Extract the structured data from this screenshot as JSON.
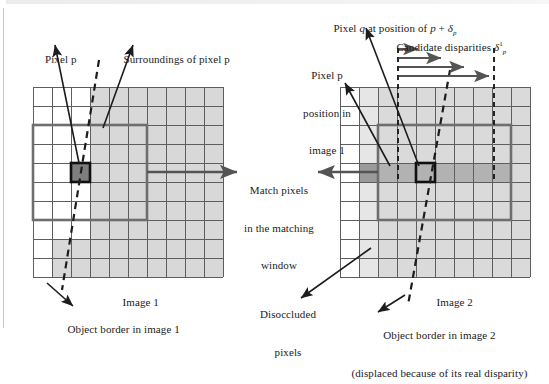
{
  "figure": {
    "type": "diagram",
    "colors": {
      "grid_line": "#5a5a5a",
      "cell_light": "#d6d6d6",
      "cell_mid": "#b9b9b9",
      "cell_dark": "#7a7a7a",
      "window_border": "#6e6e6e",
      "pixel_border": "#111111",
      "arrow": "#4d4d4d",
      "text": "#1a1a1a",
      "background": "#ffffff"
    }
  },
  "labels": {
    "pixel_p": "Pixel p",
    "surroundings": "Surroundings of pixel p",
    "image1": "Image 1",
    "image2": "Image 2",
    "object_border_1": "Object border in image 1",
    "object_border_2_line1": "Object border in image 2",
    "object_border_2_line2": "(displaced because of its real disparity)",
    "match_line1": "Match pixels",
    "match_line2": "in the matching",
    "match_line3": "window",
    "disoccluded_line1": "Disoccluded",
    "disoccluded_line2": "pixels",
    "pixel_q": "Pixel q at position of p + δp",
    "candidate": "Candidate disparities δ¹p",
    "pixel_p_pos_line1": "Pixel p",
    "pixel_p_pos_line2": "position in",
    "pixel_p_pos_line3": "image 1"
  },
  "symbols": {
    "delta": "δ",
    "p": "p",
    "q": "q",
    "superscript_1": "1"
  },
  "grids": {
    "image1": {
      "cols": 10,
      "rows": 10,
      "cell_px": 19,
      "origin": [
        33,
        87
      ],
      "shaded_region_note": "right/lower region light gray, upper-left 3 cols white",
      "pixel_p_cell": [
        2,
        4
      ],
      "window_cols": [
        0,
        4
      ],
      "window_rows": [
        2,
        7
      ]
    },
    "image2": {
      "cols": 10,
      "rows": 10,
      "cell_px": 19,
      "origin": [
        340,
        87
      ],
      "pixel_q_cell": [
        3,
        4
      ],
      "window_cols": [
        1,
        9
      ],
      "window_rows": [
        2,
        7
      ],
      "disparity_band_row": 4
    }
  },
  "candidate_disparities": {
    "count": 4,
    "arrow_lengths_px": [
      22,
      45,
      68,
      92
    ],
    "start_x": 398,
    "end_x": 494
  }
}
